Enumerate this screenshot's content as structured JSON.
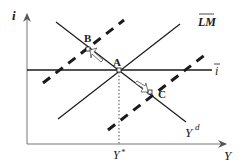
{
  "diagram": {
    "type": "IS-LM (fixed interest rate) diagram",
    "axes": {
      "y_label": "i",
      "x_label": "Y"
    },
    "curves": {
      "lm": {
        "label": "LM",
        "overline": true
      },
      "ibar": {
        "label": "i",
        "overline": true
      },
      "yd": {
        "label": "Y",
        "superscript": "d"
      }
    },
    "points": {
      "a": {
        "label": "A"
      },
      "b": {
        "label": "B"
      },
      "c": {
        "label": "C"
      }
    },
    "x_tick": {
      "label": "Y",
      "superscript": "*"
    },
    "colors": {
      "line": "#1a1a1a",
      "dotted": "#888888",
      "arrow_fill": "#ffffff"
    }
  }
}
